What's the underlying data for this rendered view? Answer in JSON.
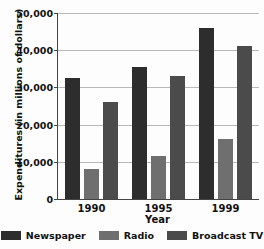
{
  "chart_data": {
    "type": "bar",
    "title": "",
    "title_note": "top title row is cropped off the image and illegible",
    "xlabel": "Year",
    "ylabel": "Expenditures (in millions of dollars)",
    "categories": [
      "1990",
      "1995",
      "1999"
    ],
    "ylim": [
      0,
      50000
    ],
    "yticks": [
      "0",
      "10,000",
      "20,000",
      "30,000",
      "40,000",
      "50,000"
    ],
    "ytick_values": [
      0,
      10000,
      20000,
      30000,
      40000,
      50000
    ],
    "grid": true,
    "legend_position": "bottom",
    "series": [
      {
        "name": "Newspaper",
        "color": "#2d2d2d",
        "values": [
          32500,
          35500,
          46000
        ]
      },
      {
        "name": "Radio",
        "color": "#6f6f6f",
        "values": [
          8000,
          11500,
          16000
        ]
      },
      {
        "name": "Broadcast TV",
        "color": "#4b4b4b",
        "values": [
          26000,
          33000,
          41000
        ]
      }
    ]
  }
}
